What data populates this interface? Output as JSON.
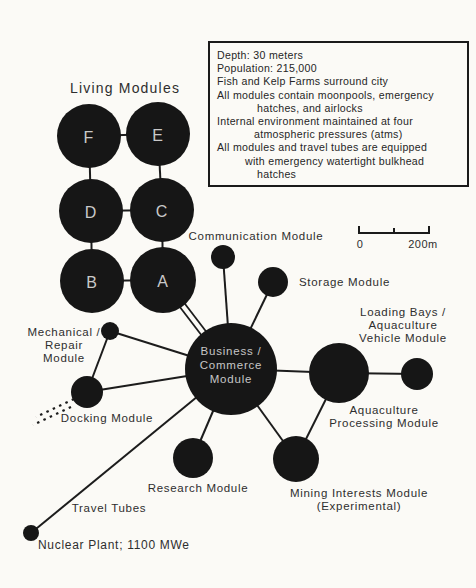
{
  "living_modules": {
    "title": "Living Modules",
    "letters": [
      "F",
      "E",
      "D",
      "C",
      "B",
      "A"
    ]
  },
  "infobox": {
    "lines": [
      "Depth: 30 meters",
      "Population: 215,000",
      "Fish and Kelp Farms surround city",
      "All modules contain moonpools, emergency",
      "hatches, and airlocks",
      "Internal environment maintained at four",
      "atmospheric pressures (atms)",
      "All modules and travel tubes are equipped",
      "with emergency watertight bulkhead",
      "hatches"
    ]
  },
  "central_module": {
    "lines": [
      "Business /",
      "Commerce",
      "Module"
    ]
  },
  "module_labels": {
    "communication": "Communication Module",
    "storage": "Storage Module",
    "loading_bays": [
      "Loading Bays /",
      "Aquaculture",
      "Vehicle Module"
    ],
    "aquaculture_processing": [
      "Aquaculture",
      "Processing Module"
    ],
    "mining": [
      "Mining Interests Module",
      "(Experimental)"
    ],
    "research": "Research Module",
    "mechanical": [
      "Mechanical /",
      "Repair",
      "Module"
    ],
    "docking": "Docking Module",
    "travel_tubes": "Travel Tubes",
    "nuclear_plant": "Nuclear Plant; 1100 MWe"
  },
  "scale_bar": {
    "start": "0",
    "end": "200m"
  },
  "colors": {
    "module_fill": "#161616",
    "connector": "#1c1c1c",
    "label_text": "#2e2e2e",
    "module_letter": "#c9c9c9",
    "background": "#fbfaf6"
  }
}
